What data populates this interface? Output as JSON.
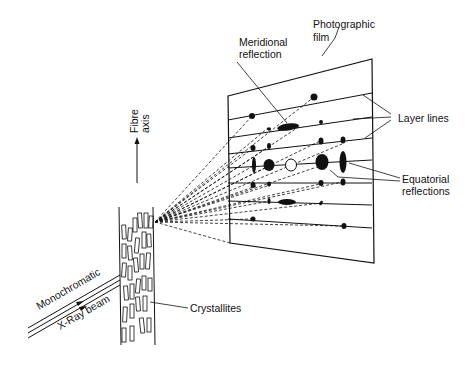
{
  "diagram": {
    "type": "fibre-x-ray-diffraction-schematic",
    "labels": {
      "photographic_film_line1": "Photographic",
      "photographic_film_line2": "film",
      "meridional_line1": "Meridional",
      "meridional_line2": "reflection",
      "layer_lines": "Layer lines",
      "equatorial_line1": "Equatorial",
      "equatorial_line2": "reflections",
      "fibre_axis_line1": "Fibre",
      "fibre_axis_line2": "axis",
      "crystallites": "Crystallites",
      "beam_line1": "Monochromatic",
      "beam_line2": "X-Ray beam"
    },
    "colors": {
      "ink": "#111111",
      "background": "#ffffff"
    }
  }
}
